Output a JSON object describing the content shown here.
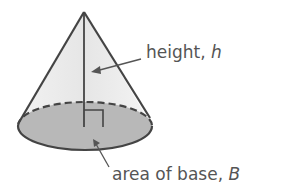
{
  "diagram": {
    "shape": "cone",
    "labels": {
      "height": {
        "text": "height, ",
        "var": "h"
      },
      "base": {
        "text": "area of base, ",
        "var": "B"
      }
    },
    "colors": {
      "outline": "#444444",
      "side_fill": "#eeeeee",
      "base_fill": "#b5b5b5",
      "text": "#555555"
    }
  }
}
